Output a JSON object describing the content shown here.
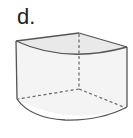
{
  "figure": {
    "label": "d.",
    "colors": {
      "stroke": "#555555",
      "front_fill": "#f4f4f4",
      "top_fill": "#e9e9e9",
      "hidden_edge": "#666666"
    }
  }
}
